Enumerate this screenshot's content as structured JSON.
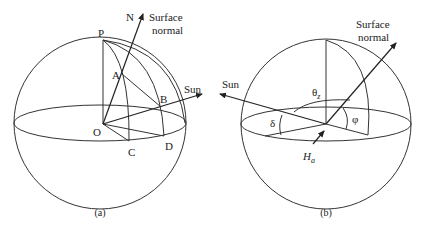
{
  "figure": {
    "panel_a": {
      "caption": "(a)",
      "labels": {
        "N": "N",
        "surface_normal_line1": "Surface",
        "surface_normal_line2": "normal",
        "P": "P",
        "A": "A",
        "B": "B",
        "O": "O",
        "C": "C",
        "D": "D",
        "sun": "Sun"
      }
    },
    "panel_b": {
      "caption": "(b)",
      "labels": {
        "surface_normal_line1": "Surface",
        "surface_normal_line2": "normal",
        "sun": "Sun",
        "theta_z": "θ",
        "theta_z_sub": "z",
        "delta": "δ",
        "phi": "φ",
        "hour_angle": "H",
        "hour_angle_sub": "a"
      }
    },
    "colors": {
      "line": "#333333",
      "background": "#ffffff"
    }
  }
}
